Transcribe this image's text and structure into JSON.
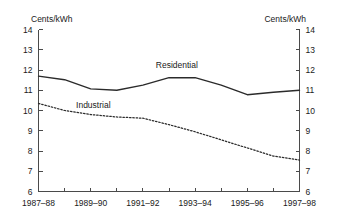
{
  "chart_data": {
    "type": "line",
    "title": "",
    "subtitle": "",
    "xlabel": "",
    "ylabel": "Cents/kWh",
    "ylabel_right": "Cents/kWh",
    "ylim": [
      6,
      14
    ],
    "yticks": [
      6,
      7,
      8,
      9,
      10,
      11,
      12,
      13,
      14
    ],
    "ytick_labels": [
      "6",
      "7",
      "8",
      "9",
      "10",
      "11",
      "12",
      "13",
      "14"
    ],
    "grid": false,
    "legend_position": "inline-annotation",
    "x": [
      "1987-88",
      "1988-89",
      "1989-90",
      "1990-91",
      "1991-92",
      "1992-93",
      "1993-94",
      "1994-95",
      "1995-96",
      "1996-97",
      "1997-98"
    ],
    "xtick_labels": [
      "1987–88",
      "1989–90",
      "1991–92",
      "1993–94",
      "1995–96",
      "1997–98"
    ],
    "xtick_label_positions": [
      0,
      2,
      4,
      6,
      8,
      10
    ],
    "series": [
      {
        "name": "Residential",
        "style": "solid",
        "color": "#2b2b2b",
        "values": [
          11.7,
          11.52,
          11.07,
          11.0,
          11.25,
          11.62,
          11.62,
          11.25,
          10.78,
          10.9,
          11.0
        ]
      },
      {
        "name": "Industrial",
        "style": "dotted",
        "color": "#2b2b2b",
        "values": [
          10.35,
          10.0,
          9.8,
          9.68,
          9.62,
          9.3,
          8.95,
          8.55,
          8.15,
          7.75,
          7.55
        ]
      }
    ],
    "annotations": [
      {
        "text": "Residential",
        "x_index": 5.3,
        "value": 12.08
      },
      {
        "text": "Industrial",
        "x_index": 2.1,
        "value": 10.12
      }
    ]
  }
}
